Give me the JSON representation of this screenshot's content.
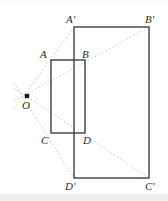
{
  "figure": {
    "background_color": "#ffffff",
    "stroke_color": "#404040",
    "ray_color": "#c8c8c8",
    "label_color": "#2b2b2b",
    "center": {
      "name": "O",
      "label": "O",
      "x": 27,
      "y": 96,
      "dot_radius": 2.2,
      "label_x": 22,
      "label_y": 100
    },
    "inner_rectangle": {
      "name": "ABCD",
      "x": 51,
      "y": 60,
      "width": 34,
      "height": 73,
      "stroke_width": 1.4
    },
    "outer_rectangle": {
      "name": "A'B'C'D'",
      "x": 74,
      "y": 27,
      "width": 75,
      "height": 151,
      "stroke_width": 1.4
    },
    "vertices": [
      {
        "label": "A",
        "point_x": 51,
        "point_y": 60,
        "label_x": 40,
        "label_y": 49
      },
      {
        "label": "B",
        "point_x": 85,
        "point_y": 60,
        "label_x": 82,
        "label_y": 49
      },
      {
        "label": "C",
        "point_x": 51,
        "point_y": 133,
        "label_x": 41,
        "label_y": 135
      },
      {
        "label": "D",
        "point_x": 85,
        "point_y": 133,
        "label_x": 83,
        "label_y": 135
      },
      {
        "label": "A'",
        "point_x": 74,
        "point_y": 27,
        "label_x": 66,
        "label_y": 14
      },
      {
        "label": "B'",
        "point_x": 149,
        "point_y": 27,
        "label_x": 145,
        "label_y": 14
      },
      {
        "label": "C'",
        "point_x": 149,
        "point_y": 178,
        "label_x": 145,
        "label_y": 181
      },
      {
        "label": "D'",
        "point_x": 74,
        "point_y": 178,
        "label_x": 65,
        "label_y": 181
      }
    ],
    "rays": [
      {
        "name": "ray-O-to-A-prime",
        "x1": 14,
        "y1": 109,
        "x2": 74,
        "y2": 27
      },
      {
        "name": "ray-O-to-B-prime",
        "x1": 14,
        "y1": 101,
        "x2": 149,
        "y2": 27
      },
      {
        "name": "ray-O-to-C-prime",
        "x1": 14,
        "y1": 88,
        "x2": 149,
        "y2": 178
      },
      {
        "name": "ray-O-to-D-prime",
        "x1": 14,
        "y1": 83,
        "x2": 74,
        "y2": 178
      }
    ],
    "ray_dash": "1.6 2.4",
    "ray_width": 1
  }
}
